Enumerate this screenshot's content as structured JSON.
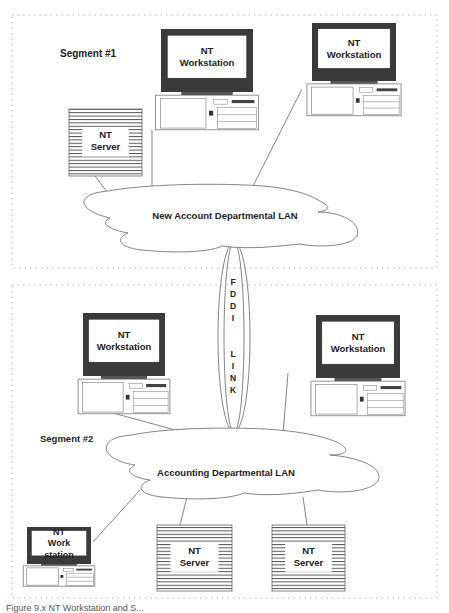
{
  "diagram": {
    "segments": [
      {
        "id": "segment-1",
        "label": "Segment #1",
        "lan_label": "New Account Departmental LAN"
      },
      {
        "id": "segment-2",
        "label": "Segment #2",
        "lan_label": "Accounting Departmental LAN"
      }
    ],
    "link": {
      "label_top": [
        "F",
        "D",
        "D",
        "I"
      ],
      "label_bottom": [
        "L",
        "I",
        "N",
        "K"
      ],
      "name": "FDDI LINK"
    },
    "nodes": {
      "ws1": {
        "line1": "NT",
        "line2": "Workstation"
      },
      "ws2": {
        "line1": "NT",
        "line2": "Workstation"
      },
      "srv1": {
        "line1": "NT",
        "line2": "Server"
      },
      "ws3": {
        "line1": "NT",
        "line2": "Workstation"
      },
      "ws4": {
        "line1": "NT",
        "line2": "Workstation"
      },
      "ws5": {
        "line1": "NT",
        "line2": "Work",
        "line3": "station"
      },
      "srv2": {
        "line1": "NT",
        "line2": "Server"
      },
      "srv3": {
        "line1": "NT",
        "line2": "Server"
      }
    },
    "colors": {
      "monitor_frame": "#3a3a3a",
      "line": "#555555",
      "dash": "#b0b0b0",
      "text": "#222222"
    }
  },
  "caption": "Figure 9.x   NT Workstation and S..."
}
